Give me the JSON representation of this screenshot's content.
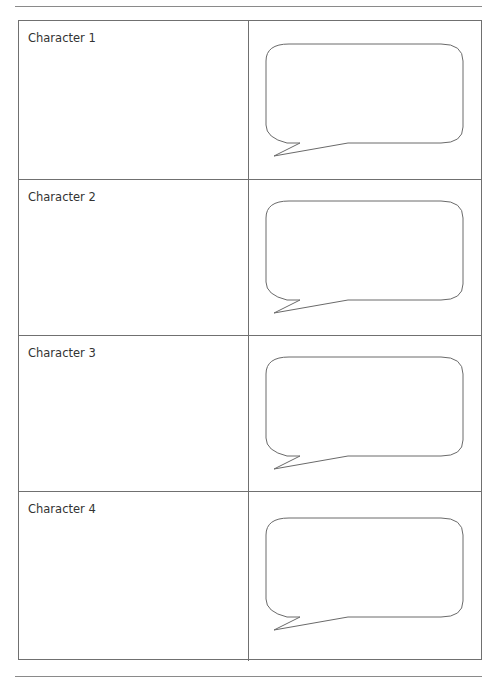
{
  "page": {
    "rows": [
      {
        "label": "Character 1"
      },
      {
        "label": "Character 2"
      },
      {
        "label": "Character 3"
      },
      {
        "label": "Character 4"
      }
    ],
    "icons": {
      "bubble": "speech-bubble-icon"
    }
  }
}
